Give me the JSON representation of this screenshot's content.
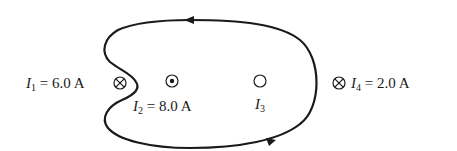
{
  "diagram": {
    "type": "ampere-loop",
    "loop": {
      "color": "#1a1a1a",
      "direction": "counterclockwise",
      "arrows": [
        {
          "position": "top",
          "points": "left"
        },
        {
          "position": "bottom",
          "points": "right"
        }
      ]
    },
    "currents": [
      {
        "id": "I1",
        "symbol": "I",
        "subscript": "1",
        "value": "6.0 A",
        "direction": "into-page",
        "glyph": "⊗",
        "inside_loop": false
      },
      {
        "id": "I2",
        "symbol": "I",
        "subscript": "2",
        "value": "8.0 A",
        "direction": "out-of-page",
        "glyph": "⊙",
        "inside_loop": true
      },
      {
        "id": "I3",
        "symbol": "I",
        "subscript": "3",
        "value": "",
        "direction": "unknown",
        "glyph": "○",
        "inside_loop": true
      },
      {
        "id": "I4",
        "symbol": "I",
        "subscript": "4",
        "value": "2.0 A",
        "direction": "into-page",
        "glyph": "⊗",
        "inside_loop": false
      }
    ],
    "labels": {
      "i1_symbol": "I",
      "i1_sub": "1",
      "i1_eq": " = 6.0 A",
      "i2_symbol": "I",
      "i2_sub": "2",
      "i2_eq": " = 8.0 A",
      "i3_symbol": "I",
      "i3_sub": "3",
      "i4_symbol": "I",
      "i4_sub": "4",
      "i4_eq": " = 2.0 A"
    }
  }
}
